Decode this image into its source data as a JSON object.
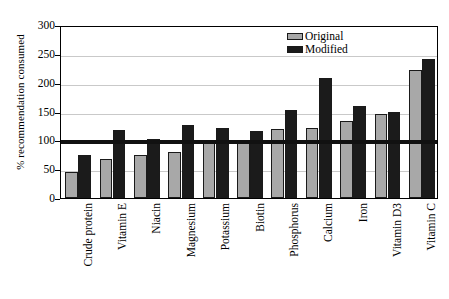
{
  "chart_data": {
    "type": "bar",
    "title": "",
    "xlabel": "",
    "ylabel": "% recommendation consumed",
    "ylim": [
      0,
      300
    ],
    "ytick_values": [
      0,
      50,
      100,
      150,
      200,
      250,
      300
    ],
    "ytick_labels": [
      "0",
      "50",
      "100",
      "150",
      "200",
      "250",
      "300"
    ],
    "grid": true,
    "grid_axis": "y",
    "legend_position": "top-right",
    "categories": [
      "Crude protein",
      "Vitamin E",
      "Niacin",
      "Magnesium",
      "Potassium",
      "Biotin",
      "Phosphorus",
      "Calcium",
      "Iron",
      "Vitamin D3",
      "Vitamin C"
    ],
    "series": [
      {
        "name": "Original",
        "color": "#a8a8a8",
        "values": [
          45,
          68,
          75,
          80,
          95,
          95,
          120,
          122,
          133,
          145,
          222
        ]
      },
      {
        "name": "Modified",
        "color": "#1b1b1b",
        "values": [
          75,
          118,
          103,
          127,
          122,
          116,
          153,
          208,
          160,
          150,
          241
        ]
      }
    ],
    "annotations": [
      {
        "type": "hline",
        "name": "recommendation-reference-line",
        "value": 100,
        "color": "#111111"
      }
    ]
  },
  "legend": {
    "items": [
      {
        "label": "Original",
        "swatch": "gray-swatch-icon"
      },
      {
        "label": "Modified",
        "swatch": "black-swatch-icon"
      }
    ]
  }
}
